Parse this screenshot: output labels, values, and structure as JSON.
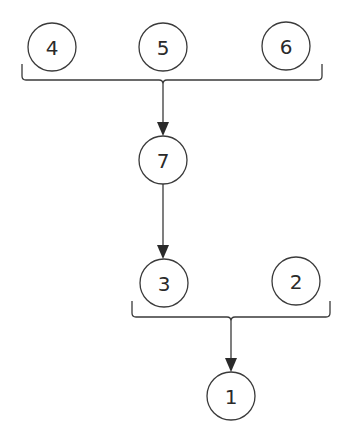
{
  "diagram": {
    "type": "tree-merge",
    "nodes": [
      {
        "id": "4",
        "label": "4",
        "cx": 52,
        "cy": 47,
        "r": 24
      },
      {
        "id": "5",
        "label": "5",
        "cx": 163,
        "cy": 47,
        "r": 24
      },
      {
        "id": "6",
        "label": "6",
        "cx": 286,
        "cy": 46,
        "r": 24
      },
      {
        "id": "7",
        "label": "7",
        "cx": 163,
        "cy": 160,
        "r": 24
      },
      {
        "id": "3",
        "label": "3",
        "cx": 164,
        "cy": 283,
        "r": 24
      },
      {
        "id": "2",
        "label": "2",
        "cx": 296,
        "cy": 281,
        "r": 24
      },
      {
        "id": "1",
        "label": "1",
        "cx": 231,
        "cy": 396,
        "r": 24
      }
    ],
    "groups": [
      {
        "id": "top-bracket",
        "members": [
          "4",
          "5",
          "6"
        ],
        "x1": 22,
        "x2": 322,
        "y": 80,
        "tick_top": 64,
        "stem_x": 163
      },
      {
        "id": "bottom-bracket",
        "members": [
          "3",
          "2"
        ],
        "x1": 132,
        "x2": 330,
        "y": 317,
        "tick_top": 301,
        "stem_x": 231
      }
    ],
    "edges": [
      {
        "from": "top-bracket",
        "to": "7",
        "x": 163,
        "y1": 80,
        "y2": 136
      },
      {
        "from": "7",
        "to": "3",
        "x": 163,
        "y1": 184,
        "y2": 259
      },
      {
        "from": "bottom-bracket",
        "to": "1",
        "x": 231,
        "y1": 317,
        "y2": 372
      }
    ],
    "colors": {
      "stroke": "#3a3a3a",
      "text": "#2a2a2a",
      "background": "#ffffff"
    }
  }
}
